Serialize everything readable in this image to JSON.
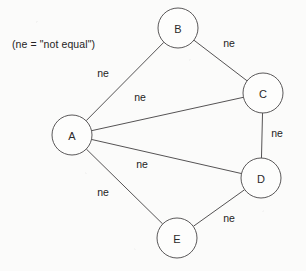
{
  "figure": {
    "caption": "(ne = \"not equal\")",
    "caption_x": 12,
    "caption_y": 38,
    "background_color": "#fbfbfa",
    "stroke_color": "#555354",
    "node_fill_color": "#fdfdfc",
    "text_color": "#242323",
    "width": 306,
    "height": 271
  },
  "chart_data": {
    "type": "diagram",
    "diagram_type": "constraint-graph",
    "title": "",
    "annotations": [
      "(ne = \"not equal\")"
    ],
    "legend": {
      "ne": "not equal"
    },
    "node_radius": 20,
    "nodes": [
      {
        "id": "A",
        "label": "A",
        "cx": 72,
        "cy": 135
      },
      {
        "id": "B",
        "label": "B",
        "cx": 178,
        "cy": 28
      },
      {
        "id": "C",
        "label": "C",
        "cx": 263,
        "cy": 93
      },
      {
        "id": "D",
        "label": "D",
        "cx": 261,
        "cy": 178
      },
      {
        "id": "E",
        "label": "E",
        "cx": 177,
        "cy": 238
      }
    ],
    "edges": [
      {
        "source": "A",
        "target": "B",
        "label": "ne",
        "label_x": 103,
        "label_y": 73
      },
      {
        "source": "B",
        "target": "C",
        "label": "ne",
        "label_x": 229,
        "label_y": 43
      },
      {
        "source": "A",
        "target": "C",
        "label": "ne",
        "label_x": 140,
        "label_y": 97
      },
      {
        "source": "C",
        "target": "D",
        "label": "ne",
        "label_x": 277,
        "label_y": 133
      },
      {
        "source": "A",
        "target": "D",
        "label": "ne",
        "label_x": 142,
        "label_y": 164
      },
      {
        "source": "A",
        "target": "E",
        "label": "ne",
        "label_x": 103,
        "label_y": 192
      },
      {
        "source": "D",
        "target": "E",
        "label": "ne",
        "label_x": 229,
        "label_y": 218
      }
    ]
  }
}
